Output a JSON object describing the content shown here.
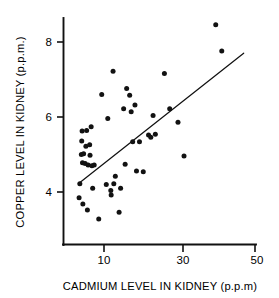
{
  "chart_data": {
    "type": "scatter",
    "title": "",
    "xlabel": "CADMIUM LEVEL IN KIDNEY (p.p.m)",
    "ylabel": "COPPER LEVEL IN KIDNEY (p.p.m.)",
    "xlim": [
      2,
      52
    ],
    "ylim": [
      3.0,
      8.8
    ],
    "xticks": [
      10,
      30,
      50
    ],
    "xtick_labels": [
      "10",
      "30",
      "50"
    ],
    "yticks": [
      4,
      6,
      8
    ],
    "ytick_labels": [
      "4",
      "6",
      "8"
    ],
    "grid": false,
    "legend": null,
    "series": [
      {
        "name": "kidney samples",
        "marker": "filled-circle",
        "color": "#121212",
        "points": [
          [
            3.4,
            3.85
          ],
          [
            3.6,
            4.22
          ],
          [
            4.0,
            5.0
          ],
          [
            4.1,
            5.36
          ],
          [
            4.2,
            5.63
          ],
          [
            4.3,
            4.78
          ],
          [
            4.4,
            3.68
          ],
          [
            4.6,
            5.02
          ],
          [
            5.0,
            4.76
          ],
          [
            5.2,
            5.22
          ],
          [
            5.4,
            5.64
          ],
          [
            5.6,
            3.52
          ],
          [
            5.8,
            4.72
          ],
          [
            6.2,
            5.26
          ],
          [
            6.3,
            4.98
          ],
          [
            6.6,
            5.74
          ],
          [
            6.8,
            4.7
          ],
          [
            7.0,
            4.1
          ],
          [
            7.4,
            4.72
          ],
          [
            8.6,
            3.28
          ],
          [
            9.4,
            6.6
          ],
          [
            10.6,
            4.2
          ],
          [
            11.0,
            5.96
          ],
          [
            11.8,
            4.04
          ],
          [
            11.9,
            3.92
          ],
          [
            12.4,
            7.22
          ],
          [
            12.6,
            4.22
          ],
          [
            13.0,
            4.42
          ],
          [
            14.0,
            3.46
          ],
          [
            14.4,
            4.1
          ],
          [
            15.2,
            6.22
          ],
          [
            15.6,
            4.74
          ],
          [
            16.0,
            6.76
          ],
          [
            16.8,
            6.58
          ],
          [
            17.2,
            6.14
          ],
          [
            17.6,
            5.34
          ],
          [
            18.2,
            6.32
          ],
          [
            18.6,
            4.56
          ],
          [
            19.4,
            5.34
          ],
          [
            20.4,
            4.54
          ],
          [
            21.8,
            5.52
          ],
          [
            22.4,
            5.46
          ],
          [
            23.0,
            6.04
          ],
          [
            23.6,
            5.54
          ],
          [
            26.0,
            7.16
          ],
          [
            27.4,
            6.22
          ],
          [
            29.6,
            5.86
          ],
          [
            31.2,
            4.96
          ],
          [
            39.6,
            8.46
          ],
          [
            41.2,
            7.76
          ]
        ]
      }
    ],
    "fit_line": {
      "name": "regression line",
      "x_start": 3.2,
      "y_start": 4.22,
      "x_end": 47.0,
      "y_end": 7.7
    }
  },
  "axes": {
    "x_axis_name": "cadmium-axis",
    "y_axis_name": "copper-axis"
  }
}
